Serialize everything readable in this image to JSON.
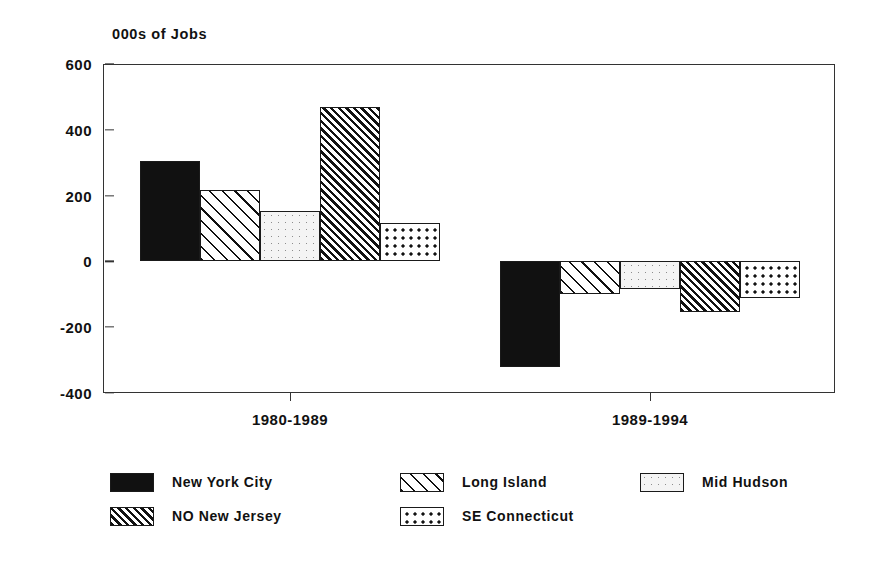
{
  "chart_data": {
    "type": "bar",
    "title": "000s of Jobs",
    "subtitle": "",
    "xlabel": "",
    "ylabel": "000s of Jobs",
    "categories": [
      "1980-1989",
      "1989-1994"
    ],
    "ylim": [
      -400,
      600
    ],
    "yticks": [
      600,
      400,
      200,
      0,
      -200,
      -400
    ],
    "ytick_labels": [
      "600",
      "400",
      "200",
      "0",
      "-200",
      "-400"
    ],
    "grid": true,
    "grid_axis": "y",
    "legend_position": "bottom",
    "orientation": "vertical",
    "series": [
      {
        "name": "New York City",
        "pattern": "solid-black",
        "values": [
          305,
          -320
        ]
      },
      {
        "name": "Long Island",
        "pattern": "diagonal-wide",
        "values": [
          218,
          -100
        ]
      },
      {
        "name": "Mid Hudson",
        "pattern": "dotted-light",
        "values": [
          152,
          -85
        ]
      },
      {
        "name": "NO New Jersey",
        "pattern": "diagonal-dense",
        "values": [
          470,
          -155
        ]
      },
      {
        "name": "SE Connecticut",
        "pattern": "checker-dots",
        "values": [
          117,
          -112
        ]
      }
    ]
  },
  "legend": {
    "items": [
      {
        "label": "New York City",
        "pattern": "solid-black"
      },
      {
        "label": "Long Island",
        "pattern": "diagonal-wide"
      },
      {
        "label": "Mid Hudson",
        "pattern": "dotted-light"
      },
      {
        "label": "NO New Jersey",
        "pattern": "diagonal-dense"
      },
      {
        "label": "SE Connecticut",
        "pattern": "checker-dots"
      }
    ]
  },
  "colors": {
    "axis": "#333333",
    "grid": "#b9b9b9",
    "series_solid": "#111111",
    "background": "#ffffff"
  }
}
